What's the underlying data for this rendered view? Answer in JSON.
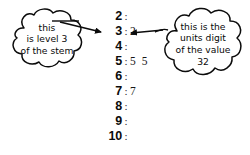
{
  "figure": {
    "background_color": "#ffffff",
    "ink_color": "#0b0b0b"
  },
  "plot": {
    "separator": ":",
    "rows": [
      {
        "stem": "2",
        "leaves": ""
      },
      {
        "stem": "3",
        "leaves": "2"
      },
      {
        "stem": "4",
        "leaves": ""
      },
      {
        "stem": "5",
        "leaves": "5 5"
      },
      {
        "stem": "6",
        "leaves": ""
      },
      {
        "stem": "7",
        "leaves": "7"
      },
      {
        "stem": "8",
        "leaves": ""
      },
      {
        "stem": "9",
        "leaves": ""
      },
      {
        "stem": "10",
        "leaves": ""
      }
    ]
  },
  "callouts": {
    "left": {
      "line1": "this",
      "line2": "is level 3",
      "line3": "of the stem",
      "points_to": "3"
    },
    "right": {
      "line1": "this is the",
      "line2": "units digit",
      "line3": "of the value",
      "line4": "32",
      "points_to": "2"
    }
  }
}
